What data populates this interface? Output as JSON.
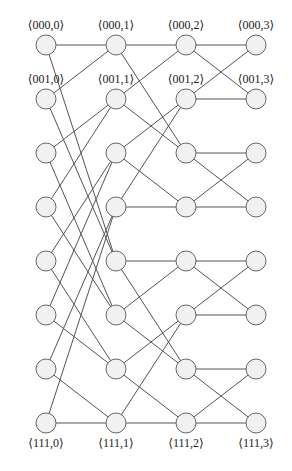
{
  "diagram": {
    "type": "butterfly-network",
    "columns_x": [
      46,
      116,
      186,
      256
    ],
    "rows_y": [
      45,
      99,
      153,
      207,
      261,
      315,
      369,
      423
    ],
    "node_radius": 10,
    "colors": {
      "node_fill": "#f1f1f1",
      "node_stroke": "#666666",
      "edge": "#555555",
      "text": "#222222"
    },
    "labels": [
      {
        "text": "⟨000,0⟩",
        "col": 0,
        "row": 0,
        "pos": "above"
      },
      {
        "text": "⟨000,1⟩",
        "col": 1,
        "row": 0,
        "pos": "above"
      },
      {
        "text": "⟨000,2⟩",
        "col": 2,
        "row": 0,
        "pos": "above"
      },
      {
        "text": "⟨000,3⟩",
        "col": 3,
        "row": 0,
        "pos": "above"
      },
      {
        "text": "⟨001,0⟩",
        "col": 0,
        "row": 1,
        "pos": "above"
      },
      {
        "text": "⟨001,1⟩",
        "col": 1,
        "row": 1,
        "pos": "above"
      },
      {
        "text": "⟨001,2⟩",
        "col": 2,
        "row": 1,
        "pos": "above"
      },
      {
        "text": "⟨001,3⟩",
        "col": 3,
        "row": 1,
        "pos": "above"
      },
      {
        "text": "⟨111,0⟩",
        "col": 0,
        "row": 7,
        "pos": "below"
      },
      {
        "text": "⟨111,1⟩",
        "col": 1,
        "row": 7,
        "pos": "below"
      },
      {
        "text": "⟨111,2⟩",
        "col": 2,
        "row": 7,
        "pos": "below"
      },
      {
        "text": "⟨111,3⟩",
        "col": 3,
        "row": 7,
        "pos": "below"
      }
    ],
    "edges": {
      "stage0_to_1": [
        [
          0,
          0
        ],
        [
          0,
          4
        ],
        [
          1,
          0
        ],
        [
          1,
          4
        ],
        [
          2,
          1
        ],
        [
          2,
          5
        ],
        [
          3,
          1
        ],
        [
          3,
          5
        ],
        [
          4,
          2
        ],
        [
          4,
          6
        ],
        [
          5,
          2
        ],
        [
          5,
          6
        ],
        [
          6,
          3
        ],
        [
          6,
          7
        ],
        [
          7,
          3
        ],
        [
          7,
          7
        ]
      ],
      "stage1_to_2": [
        [
          0,
          0
        ],
        [
          0,
          2
        ],
        [
          1,
          0
        ],
        [
          1,
          2
        ],
        [
          2,
          1
        ],
        [
          2,
          3
        ],
        [
          3,
          1
        ],
        [
          3,
          3
        ],
        [
          4,
          4
        ],
        [
          4,
          6
        ],
        [
          5,
          4
        ],
        [
          5,
          6
        ],
        [
          6,
          5
        ],
        [
          6,
          7
        ],
        [
          7,
          5
        ],
        [
          7,
          7
        ]
      ],
      "stage2_to_3": [
        [
          0,
          0
        ],
        [
          0,
          1
        ],
        [
          1,
          0
        ],
        [
          1,
          1
        ],
        [
          2,
          2
        ],
        [
          2,
          3
        ],
        [
          3,
          2
        ],
        [
          3,
          3
        ],
        [
          4,
          4
        ],
        [
          4,
          5
        ],
        [
          5,
          4
        ],
        [
          5,
          5
        ],
        [
          6,
          6
        ],
        [
          6,
          7
        ],
        [
          7,
          6
        ],
        [
          7,
          7
        ]
      ]
    }
  }
}
